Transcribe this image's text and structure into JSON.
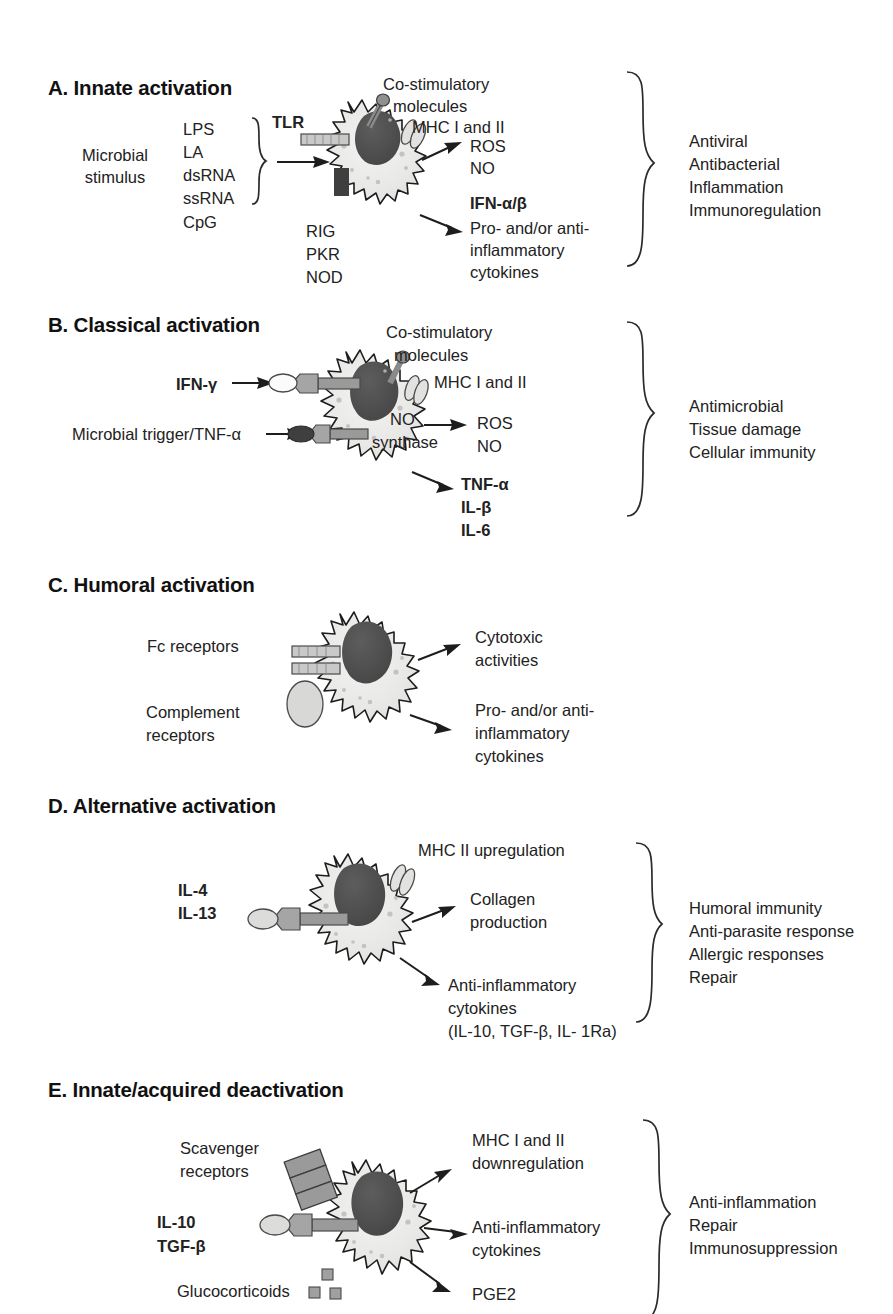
{
  "figure": {
    "type": "biological-schematic",
    "panel_count": 5
  },
  "colors": {
    "cytoplasm": "#e9e9e7",
    "cytoplasm_edge": "#1d1d1d",
    "nucleus": "#4f4f4f",
    "receptor_gray": "#9a9a9a",
    "receptor_light": "#c9c9c9",
    "receptor_dark": "#4a4a4a",
    "text": "#222222",
    "bracket": "#2b2b2b"
  },
  "panels": [
    {
      "id": "A",
      "heading": "A. Innate activation",
      "left_label": [
        "Microbial",
        "stimulus"
      ],
      "ligand_list": [
        "LPS",
        "LA",
        "dsRNA",
        "ssRNA",
        "CpG"
      ],
      "receptor_label": "TLR",
      "intracellular_sensors": [
        "RIG",
        "PKR",
        "NOD"
      ],
      "surface_labels": {
        "costim": [
          "Co-stimulatory",
          "molecules"
        ],
        "mhc": "MHC I and II"
      },
      "outputs_top": [
        "ROS",
        "NO"
      ],
      "outputs_bottom_bold": "IFN-α/β",
      "outputs_bottom": [
        "Pro- and/or anti-",
        "inflammatory",
        "cytokines"
      ],
      "effects": [
        "Antiviral",
        "Antibacterial",
        "Inflammation",
        "Immunoregulation"
      ]
    },
    {
      "id": "B",
      "heading": "B. Classical activation",
      "inputs": [
        "IFN-γ",
        "Microbial trigger/TNF-α"
      ],
      "inputs_bold": [
        true,
        false
      ],
      "surface_labels": {
        "costim": [
          "Co-stimulatory",
          "molecules"
        ],
        "mhc": "MHC I and II"
      },
      "intracellular_label": [
        "NO",
        "synthase"
      ],
      "outputs_top": [
        "ROS",
        "NO"
      ],
      "outputs_bottom": [
        "TNF-α",
        "IL-β",
        "IL-6"
      ],
      "effects": [
        "Antimicrobial",
        "Tissue damage",
        "Cellular immunity"
      ]
    },
    {
      "id": "C",
      "heading": "C. Humoral activation",
      "inputs": [
        [
          "Fc receptors"
        ],
        [
          "Complement",
          "receptors"
        ]
      ],
      "outputs": [
        [
          "Cytotoxic",
          "activities"
        ],
        [
          "Pro- and/or anti-",
          "inflammatory",
          "cytokines"
        ]
      ],
      "effects": []
    },
    {
      "id": "D",
      "heading": "D. Alternative activation",
      "inputs_bold": [
        "IL-4",
        "IL-13"
      ],
      "surface_labels": {
        "mhc": "MHC II upregulation"
      },
      "outputs": [
        [
          "Collagen",
          "production"
        ],
        [
          "Anti-inflammatory",
          "cytokines",
          "(IL-10, TGF-β, IL- 1Ra)"
        ]
      ],
      "effects": [
        "Humoral immunity",
        "Anti-parasite response",
        "Allergic responses",
        "Repair"
      ]
    },
    {
      "id": "E",
      "heading": "E. Innate/acquired deactivation",
      "receptor_label": [
        "Scavenger",
        "receptors"
      ],
      "inputs_bold": [
        "IL-10",
        "TGF-β"
      ],
      "extra_input": "Glucocorticoids",
      "outputs": [
        [
          "MHC I and II",
          "downregulation"
        ],
        [
          "Anti-inflammatory",
          "cytokines"
        ],
        [
          "PGE2"
        ]
      ],
      "effects": [
        "Anti-inflammation",
        "Repair",
        "Immunosuppression"
      ]
    }
  ]
}
